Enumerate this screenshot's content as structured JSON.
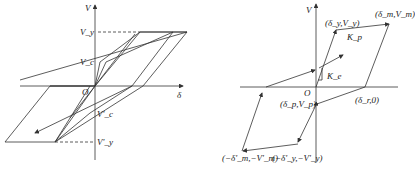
{
  "left_diagram": {
    "axis_v_label": "V",
    "axis_delta_label": "δ",
    "origin_label": "O",
    "vy_label": "V_y",
    "vc_label": "V_c",
    "vc_neg_label": "V'_c",
    "vy_neg_label": "V'_y"
  },
  "right_diagram": {
    "axis_v_label": "V",
    "origin_label": "O",
    "point_yield": "(δ_y,V_y)",
    "point_max": "(δ_m,V_m)",
    "point_residual": "(δ_r,0)",
    "point_p": "(δ_p,V_p)",
    "point_neg_max": "(−δ'_m,−V'_m)",
    "point_neg_yield": "(−δ'_y,−V'_y)",
    "kp_label": "K_p",
    "ke_label": "K_e"
  },
  "colors": {
    "line": "#333333",
    "background": "#ffffff"
  }
}
